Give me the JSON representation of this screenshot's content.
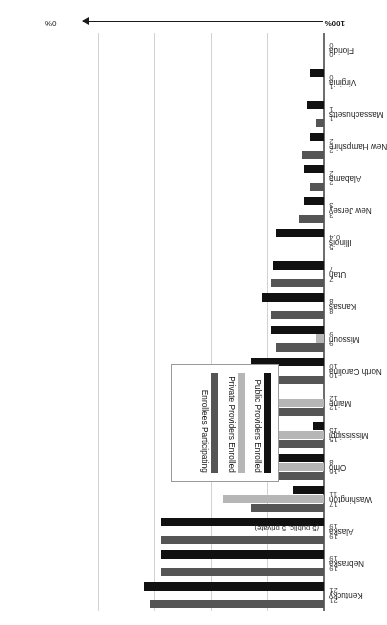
{
  "chart_data": {
    "type": "bar",
    "orientation": "horizontal",
    "title": "",
    "xlabel": "",
    "ylabel": "",
    "xlim": [
      0,
      100
    ],
    "x_axis_start_label": "0%",
    "x_axis_end_label": "100%",
    "grid": true,
    "gridlines_pct": [
      20,
      40,
      60,
      80
    ],
    "legend_position": "inside-left",
    "annotation": "(5 public, 5 private)",
    "legend": [
      {
        "label": "Public Providers Enrolled",
        "color": "#111111",
        "key": "public"
      },
      {
        "label": "Private Providers Enrolled",
        "color": "#b6b6b6",
        "key": "private"
      },
      {
        "label": "Enrollees Participating",
        "color": "#555555",
        "key": "enrollees"
      }
    ],
    "categories": [
      "Kentucky",
      "Nebraska",
      "Alaska",
      "Washington",
      "Ohio",
      "Mississippi",
      "Maine",
      "North Carolina",
      "Missouri",
      "Kansas",
      "Utah",
      "Illinois",
      "New Jersey",
      "Alabama",
      "New Hampshire",
      "Massachusetts",
      "Virginia",
      "Florida"
    ],
    "series": [
      {
        "name": "Public Providers Enrolled",
        "color": "#111111",
        "values": [
          64,
          58,
          58,
          11,
          23,
          4,
          0,
          26,
          19,
          22,
          18,
          17,
          7,
          7,
          5,
          6,
          5,
          0
        ]
      },
      {
        "name": "Private Providers Enrolled",
        "color": "#b6b6b6",
        "values": [
          0,
          0,
          0,
          36,
          29,
          33,
          28,
          0,
          3,
          0,
          0,
          0,
          0,
          0,
          0,
          0,
          0,
          0
        ]
      },
      {
        "name": "Enrollees Participating",
        "color": "#555555",
        "values": [
          62,
          58,
          58,
          26,
          18,
          34,
          32,
          26,
          17,
          19,
          19,
          0,
          9,
          5,
          8,
          3,
          0,
          0
        ]
      }
    ],
    "row_value_labels": [
      {
        "category": "Kentucky",
        "labels": [
          "21",
          "21"
        ]
      },
      {
        "category": "Nebraska",
        "labels": [
          "19",
          "19"
        ]
      },
      {
        "category": "Alaska",
        "labels": [
          "19",
          "19"
        ]
      },
      {
        "category": "Washington",
        "labels": [
          "17",
          "11"
        ]
      },
      {
        "category": "Ohio",
        "labels": [
          "16",
          "8"
        ]
      },
      {
        "category": "Mississippi",
        "labels": [
          "15",
          "15"
        ]
      },
      {
        "category": "Maine",
        "labels": [
          "12",
          "12"
        ]
      },
      {
        "category": "North Carolina",
        "labels": [
          "10",
          "10"
        ]
      },
      {
        "category": "Missouri",
        "labels": [
          "9",
          "9"
        ]
      },
      {
        "category": "Kansas",
        "labels": [
          "8",
          "8"
        ]
      },
      {
        "category": "Utah",
        "labels": [
          "7",
          "7"
        ]
      },
      {
        "category": "Illinois",
        "labels": [
          "5",
          "0.4"
        ]
      },
      {
        "category": "New Jersey",
        "labels": [
          "3",
          "3"
        ]
      },
      {
        "category": "Alabama",
        "labels": [
          "2",
          "2"
        ]
      },
      {
        "category": "New Hampshire",
        "labels": [
          "2",
          "2"
        ]
      },
      {
        "category": "Massachusetts",
        "labels": [
          "1",
          "1"
        ]
      },
      {
        "category": "Virginia",
        "labels": [
          "1",
          "0"
        ]
      },
      {
        "category": "Florida",
        "labels": [
          "0",
          "0"
        ]
      }
    ]
  }
}
